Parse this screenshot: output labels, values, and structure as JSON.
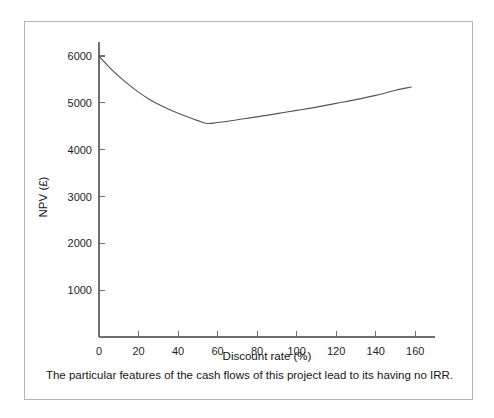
{
  "figure": {
    "caption": "The particular features of the cash flows of this project lead to its having no IRR.",
    "border_color": "#b4b4b4",
    "background": "#ffffff"
  },
  "chart_data": {
    "type": "line",
    "title": "",
    "xlabel": "Discount rate (%)",
    "ylabel": "NPV (£)",
    "xlim": [
      0,
      170
    ],
    "ylim": [
      0,
      6300
    ],
    "xticks": [
      0,
      20,
      40,
      60,
      80,
      100,
      120,
      140,
      160
    ],
    "xtick_labels": [
      "0",
      "20",
      "40",
      "60",
      "80",
      "100",
      "120",
      "140",
      "160"
    ],
    "yticks": [
      1000,
      2000,
      3000,
      4000,
      5000,
      6000
    ],
    "ytick_labels": [
      "1000",
      "2000",
      "3000",
      "4000",
      "5000",
      "6000"
    ],
    "grid": false,
    "legend": false,
    "line_color": "#555555",
    "series": [
      {
        "name": "NPV",
        "x": [
          0,
          5,
          10,
          15,
          20,
          25,
          30,
          35,
          40,
          45,
          50,
          55,
          60,
          70,
          80,
          90,
          100,
          110,
          120,
          130,
          140,
          150,
          158
        ],
        "values": [
          6000,
          5770,
          5570,
          5390,
          5230,
          5090,
          4970,
          4870,
          4780,
          4700,
          4620,
          4560,
          4580,
          4640,
          4700,
          4770,
          4840,
          4910,
          4990,
          5070,
          5160,
          5270,
          5340
        ]
      }
    ],
    "annotations": [
      {
        "label": "minimum",
        "x": 55,
        "y": 4560
      },
      {
        "label": "start",
        "x": 0,
        "y": 6000
      },
      {
        "label": "end",
        "x": 158,
        "y": 5340
      }
    ]
  },
  "axis_labels": {
    "x_title": "Discount rate (%)",
    "y_title": "NPV (£)"
  }
}
